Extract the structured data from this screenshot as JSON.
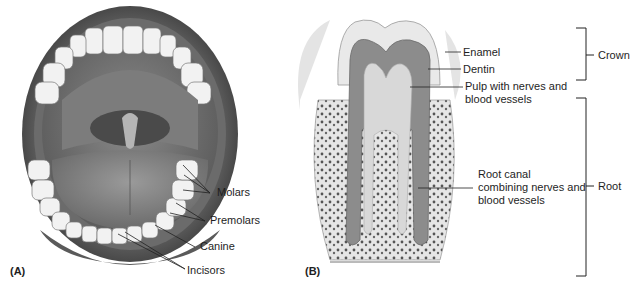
{
  "figure": {
    "panel_a": {
      "label": "(A)",
      "title": "Open mouth with teeth",
      "labels": {
        "molars": "Molars",
        "premolars": "Premolars",
        "canine": "Canine",
        "incisors": "Incisors"
      }
    },
    "panel_b": {
      "label": "(B)",
      "title": "Tooth cross-section",
      "labels": {
        "enamel": "Enamel",
        "dentin": "Dentin",
        "pulp_1": "Pulp with nerves and",
        "pulp_2": "blood vessels",
        "canal_1": "Root canal",
        "canal_2": "combining nerves and",
        "canal_3": "blood vessels"
      },
      "brackets": {
        "crown": "Crown",
        "root": "Root"
      }
    }
  }
}
